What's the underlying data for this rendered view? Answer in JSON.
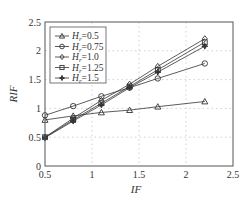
{
  "chart_data": {
    "type": "line",
    "title": "",
    "xlabel": "IF",
    "ylabel": "RIF",
    "xlim": [
      0.5,
      2.5
    ],
    "ylim": [
      0,
      2.5
    ],
    "xticks": [
      "0.5",
      "1",
      "1.5",
      "2",
      "2.5"
    ],
    "yticks": [
      "0",
      "0.5",
      "1",
      "1.5",
      "2",
      "2.5"
    ],
    "grid": true,
    "legend_position": "upper left",
    "x": [
      0.5,
      0.8,
      1.1,
      1.4,
      1.7,
      2.2
    ],
    "series": [
      {
        "name": "Hr=0.5",
        "label_main": "H",
        "label_sub": "r",
        "label_val": "=0.5",
        "marker": "triangle",
        "values": [
          0.8,
          0.87,
          0.93,
          0.97,
          1.03,
          1.12
        ]
      },
      {
        "name": "Hr=0.75",
        "label_main": "H",
        "label_sub": "r",
        "label_val": "=0.75",
        "marker": "circle",
        "values": [
          0.88,
          1.04,
          1.21,
          1.36,
          1.52,
          1.78
        ]
      },
      {
        "name": "Hr=1.0",
        "label_main": "H",
        "label_sub": "r",
        "label_val": "=1.0",
        "marker": "diamond",
        "values": [
          0.5,
          0.83,
          1.14,
          1.42,
          1.73,
          2.21
        ]
      },
      {
        "name": "Hr=1.25",
        "label_main": "H",
        "label_sub": "r",
        "label_val": "=1.25",
        "marker": "square",
        "values": [
          0.5,
          0.8,
          1.09,
          1.38,
          1.67,
          2.15
        ]
      },
      {
        "name": "Hr=1.5",
        "label_main": "H",
        "label_sub": "r",
        "label_val": "=1.5",
        "marker": "star",
        "values": [
          0.49,
          0.78,
          1.06,
          1.36,
          1.63,
          2.08
        ]
      }
    ],
    "colors": {
      "line": "#333333",
      "axis": "#555555",
      "grid": "#bbbbbb"
    }
  }
}
